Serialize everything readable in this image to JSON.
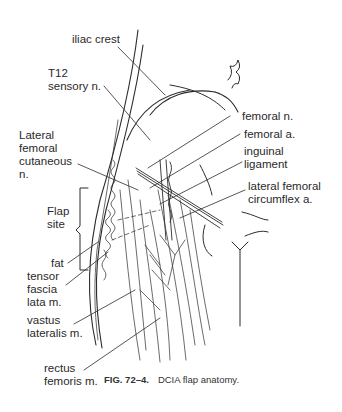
{
  "figure": {
    "caption_number": "FIG. 72–4.",
    "caption_text": "DCIA flap anatomy."
  },
  "labels": {
    "iliac_crest": "iliac crest",
    "t12_sensory": "T12\nsensory n.",
    "lateral_femoral_cutaneous": "Lateral\nfemoral\ncutaneous\nn.",
    "flap_site": "Flap\nsite",
    "fat": "fat",
    "tensor_fascia_lata": "tensor\nfascia\nlata m.",
    "vastus_lateralis": "vastus\nlateralis m.",
    "rectus_femoris": "rectus\nfemoris m.",
    "femoral_n": "femoral n.",
    "femoral_a": "femoral a.",
    "inguinal_ligament": "inguinal\nligament",
    "lateral_femoral_circumflex": "lateral femoral\ncircumflex a."
  }
}
